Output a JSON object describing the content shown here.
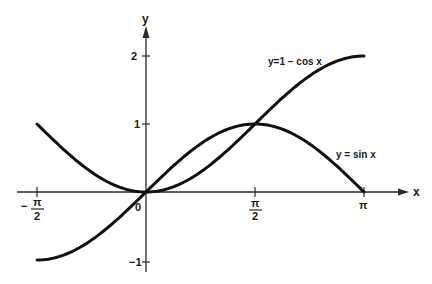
{
  "chart_data": {
    "type": "line",
    "title": "",
    "xlabel": "x",
    "ylabel": "y",
    "xlim": [
      -1.5708,
      3.1416
    ],
    "ylim": [
      -1,
      2
    ],
    "grid": false,
    "legend": "inline labels on curves",
    "x_ticks": [
      {
        "value": -1.5708,
        "label_sign": "−",
        "label_num": "π",
        "label_den": "2"
      },
      {
        "value": 0,
        "label": "0"
      },
      {
        "value": 1.5708,
        "label_num": "π",
        "label_den": "2"
      },
      {
        "value": 3.1416,
        "label": "π"
      }
    ],
    "y_ticks": [
      {
        "value": 2,
        "label": "2"
      },
      {
        "value": 1,
        "label": "1"
      },
      {
        "value": -1,
        "label": "−1"
      }
    ],
    "series": [
      {
        "name": "y = sin x",
        "label": "y = sin x",
        "function": "sin",
        "domain": [
          0,
          3.1416
        ],
        "x": [
          0,
          0.3927,
          0.7854,
          1.1781,
          1.5708,
          1.9635,
          2.3562,
          2.7489,
          3.1416
        ],
        "y": [
          0,
          0.383,
          0.707,
          0.924,
          1.0,
          0.924,
          0.707,
          0.383,
          0
        ]
      },
      {
        "name": "y = 1 − cos x",
        "label": "y = 1 − cos x",
        "function": "one_minus_cos",
        "domain": [
          0,
          3.1416
        ],
        "x": [
          0,
          0.3927,
          0.7854,
          1.1781,
          1.5708,
          1.9635,
          2.3562,
          2.7489,
          3.1416
        ],
        "y": [
          0,
          0.076,
          0.293,
          0.617,
          1.0,
          1.383,
          1.707,
          1.924,
          2.0
        ]
      },
      {
        "name": "y = sin x (negative branch)",
        "function": "sin",
        "domain": [
          -1.5708,
          0
        ],
        "x": [
          -1.5708,
          -1.1781,
          -0.7854,
          -0.3927,
          0
        ],
        "y": [
          -1.0,
          -0.924,
          -0.707,
          -0.383,
          0
        ]
      },
      {
        "name": "y = 1 − cos x (negative branch)",
        "function": "one_minus_cos",
        "domain": [
          -1.5708,
          0
        ],
        "x": [
          -1.5708,
          -1.1781,
          -0.7854,
          -0.3927,
          0
        ],
        "y": [
          1.0,
          0.617,
          0.293,
          0.076,
          0
        ]
      }
    ],
    "annotations": [
      {
        "text": "y = 1 − cos x",
        "near": [
          2.2,
          1.75
        ]
      },
      {
        "text": "y = sin x",
        "near": [
          2.6,
          0.7
        ]
      }
    ]
  },
  "labels": {
    "y_axis": "y",
    "x_axis": "x",
    "origin": "0",
    "tick_y2": "2",
    "tick_y1": "1",
    "tick_ym1": "−1",
    "tick_pi": "π",
    "tick_pi_half_num": "π",
    "tick_pi_half_den": "2",
    "tick_neg_sign": "−",
    "tick_neg_pi_half_num": "π",
    "tick_neg_pi_half_den": "2",
    "curve_cos_label": "y=1 − cos x",
    "curve_sin_label": "y = sin x"
  }
}
